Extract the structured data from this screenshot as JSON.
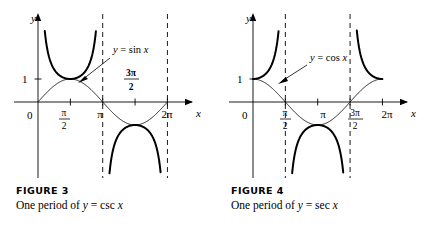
{
  "figures": [
    {
      "id": "figure-3",
      "caption_title": "FIGURE 3",
      "caption_prefix": "One period of ",
      "caption_lhs": "y",
      "caption_eq": " = ",
      "caption_func": "csc",
      "caption_arg": " x",
      "axis_y_label": "y",
      "axis_x_label": "x",
      "origin_label": "0",
      "y_tick_label": "1",
      "annotation": {
        "lhs": "y",
        "eq": " = ",
        "func": "sin",
        "arg": " x"
      },
      "x_ticks": [
        {
          "label": "π/2",
          "type": "fraction",
          "num": "π",
          "den": "2"
        },
        {
          "label": "π",
          "type": "plain",
          "text": "π"
        },
        {
          "label": "3π/2",
          "type": "fraction",
          "num": "3π",
          "den": "2"
        },
        {
          "label": "2π",
          "type": "plain",
          "text": "2π"
        }
      ],
      "chart_data": {
        "type": "line",
        "title": "One period of y = csc x",
        "xlabel": "x",
        "ylabel": "y",
        "xlim": [
          -0.35,
          7.1
        ],
        "ylim": [
          -3.4,
          3.4
        ],
        "grid": false,
        "legend": "inline-annotation",
        "asymptotes_x": [
          3.14159265,
          6.28318531
        ],
        "tick_values_x": [
          1.5708,
          3.14159,
          4.71239,
          6.28319
        ],
        "tick_values_y": [
          1
        ],
        "series": [
          {
            "name": "y = csc x",
            "style": "thick-solid",
            "branches": [
              {
                "domain": [
                  0.33,
                  2.81
                ],
                "note": "positive branch, minimum 1 at x = π/2"
              },
              {
                "domain": [
                  3.47,
                  5.95
                ],
                "note": "negative branch, maximum -1 at x = 3π/2"
              }
            ]
          },
          {
            "name": "y = sin x",
            "style": "thin-solid",
            "domain": [
              0,
              6.28319
            ],
            "note": "reference sine curve, amplitude 1, zeros at 0, π, 2π"
          }
        ]
      }
    },
    {
      "id": "figure-4",
      "caption_title": "FIGURE 4",
      "caption_prefix": "One period of ",
      "caption_lhs": "y",
      "caption_eq": " = ",
      "caption_func": "sec",
      "caption_arg": " x",
      "axis_y_label": "y",
      "axis_x_label": "x",
      "origin_label": "0",
      "y_tick_label": "1",
      "annotation": {
        "lhs": "y",
        "eq": " = ",
        "func": "cos",
        "arg": " x"
      },
      "x_ticks": [
        {
          "label": "π/2",
          "type": "fraction",
          "num": "π",
          "den": "2"
        },
        {
          "label": "π",
          "type": "plain",
          "text": "π"
        },
        {
          "label": "3π/2",
          "type": "fraction",
          "num": "3π",
          "den": "2"
        },
        {
          "label": "2π",
          "type": "plain",
          "text": "2π"
        }
      ],
      "chart_data": {
        "type": "line",
        "title": "One period of y = sec x",
        "xlabel": "x",
        "ylabel": "y",
        "xlim": [
          -0.35,
          7.1
        ],
        "ylim": [
          -3.4,
          3.4
        ],
        "grid": false,
        "legend": "inline-annotation",
        "asymptotes_x": [
          1.5708,
          4.71239
        ],
        "tick_values_x": [
          1.5708,
          3.14159,
          4.71239,
          6.28319
        ],
        "tick_values_y": [
          1
        ],
        "series": [
          {
            "name": "y = sec x",
            "style": "thick-solid",
            "branches": [
              {
                "domain": [
                  0.0,
                  1.24
                ],
                "note": "right-rising branch from (0,1)"
              },
              {
                "domain": [
                  1.9,
                  4.38
                ],
                "note": "negative branch, maximum -1 at x = π"
              },
              {
                "domain": [
                  5.04,
                  6.28
                ],
                "note": "branch falling to (2π,1)"
              }
            ]
          },
          {
            "name": "y = cos x",
            "style": "thin-solid",
            "domain": [
              0,
              6.28319
            ],
            "note": "reference cosine curve, amplitude 1, zeros at π/2, 3π/2"
          }
        ]
      }
    }
  ]
}
